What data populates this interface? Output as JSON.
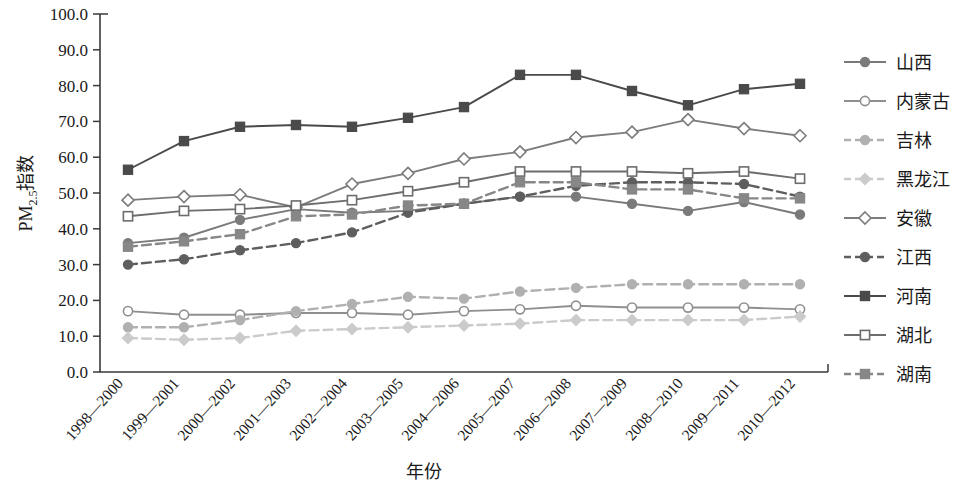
{
  "chart_data": {
    "type": "line",
    "title": "",
    "xlabel": "年份",
    "ylabel": "PM2.5指数",
    "ylabel_main": "PM",
    "ylabel_sub": "2.5",
    "ylabel_tail": "指数",
    "ylim": [
      0,
      100
    ],
    "ytick_step": 10,
    "grid": false,
    "legend_position": "right",
    "yticks": [
      "0.0",
      "10.0",
      "20.0",
      "30.0",
      "40.0",
      "50.0",
      "60.0",
      "70.0",
      "80.0",
      "90.0",
      "100.0"
    ],
    "categories": [
      "1998—2000",
      "1999—2001",
      "2000—2002",
      "2001—2003",
      "2002—2004",
      "2003—2005",
      "2004—2006",
      "2005—2007",
      "2006—2008",
      "2007—2009",
      "2008—2010",
      "2009—2011",
      "2010—2012"
    ],
    "series": [
      {
        "name": "山西",
        "color": "#7a7a7a",
        "marker": "filled-circle",
        "dash": "solid",
        "values": [
          36.0,
          37.5,
          42.5,
          45.5,
          44.5,
          45.0,
          47.0,
          49.0,
          49.0,
          47.0,
          45.0,
          47.5,
          44.0
        ]
      },
      {
        "name": "内蒙古",
        "color": "#8f8f8f",
        "marker": "open-circle",
        "dash": "solid",
        "values": [
          17.0,
          16.0,
          16.0,
          16.5,
          16.5,
          16.0,
          17.0,
          17.5,
          18.5,
          18.0,
          18.0,
          18.0,
          17.5
        ]
      },
      {
        "name": "吉林",
        "color": "#b0b0b0",
        "marker": "filled-circle",
        "dash": "dashed",
        "values": [
          12.5,
          12.5,
          14.5,
          17.0,
          19.0,
          21.0,
          20.5,
          22.5,
          23.5,
          24.5,
          24.5,
          24.5,
          24.5
        ]
      },
      {
        "name": "黑龙江",
        "color": "#cbcbcb",
        "marker": "diamond-filled",
        "dash": "dashed",
        "values": [
          9.5,
          9.0,
          9.5,
          11.5,
          12.0,
          12.5,
          13.0,
          13.5,
          14.5,
          14.5,
          14.5,
          14.5,
          15.5
        ]
      },
      {
        "name": "安徽",
        "color": "#7c7c7c",
        "marker": "open-diamond",
        "dash": "solid",
        "values": [
          48.0,
          49.0,
          49.5,
          46.0,
          52.5,
          55.5,
          59.5,
          61.5,
          65.5,
          67.0,
          70.5,
          68.0,
          66.0
        ]
      },
      {
        "name": "江西",
        "color": "#5e5e5e",
        "marker": "filled-circle",
        "dash": "dashed",
        "values": [
          30.0,
          31.5,
          34.0,
          36.0,
          39.0,
          44.5,
          47.0,
          49.0,
          52.0,
          53.0,
          53.0,
          52.5,
          49.0
        ]
      },
      {
        "name": "河南",
        "color": "#4a4a4a",
        "marker": "filled-square",
        "dash": "solid",
        "values": [
          56.5,
          64.5,
          68.5,
          69.0,
          68.5,
          71.0,
          74.0,
          83.0,
          83.0,
          78.5,
          74.5,
          79.0,
          80.5
        ]
      },
      {
        "name": "湖北",
        "color": "#6d6d6d",
        "marker": "open-square",
        "dash": "solid",
        "values": [
          43.5,
          45.0,
          45.5,
          46.5,
          48.0,
          50.5,
          53.0,
          56.0,
          56.0,
          56.0,
          55.5,
          56.0,
          54.0
        ]
      },
      {
        "name": "湖南",
        "color": "#878787",
        "marker": "filled-square",
        "dash": "dashed",
        "values": [
          35.0,
          36.5,
          38.5,
          43.5,
          44.0,
          46.5,
          47.0,
          53.0,
          53.0,
          51.0,
          51.0,
          48.5,
          48.5
        ]
      }
    ]
  }
}
